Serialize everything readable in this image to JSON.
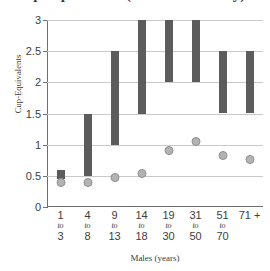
{
  "chart_data": {
    "type": "bar",
    "title": "Cup-Equivalents (Amount of Dairy)",
    "xlabel": "Males (years)",
    "ylabel": "Cup-Equivalents",
    "categories": [
      "1 to 3",
      "4 to 8",
      "9 to 13",
      "14 to 18",
      "19 to 30",
      "31 to 50",
      "51 to 70",
      "71 +"
    ],
    "category_parts": [
      {
        "from": "1",
        "sep": "to",
        "to": "3"
      },
      {
        "from": "4",
        "sep": "to",
        "to": "8"
      },
      {
        "from": "9",
        "sep": "to",
        "to": "13"
      },
      {
        "from": "14",
        "sep": "to",
        "to": "18"
      },
      {
        "from": "19",
        "sep": "to",
        "to": "30"
      },
      {
        "from": "31",
        "sep": "to",
        "to": "50"
      },
      {
        "from": "51",
        "sep": "to",
        "to": "70"
      },
      {
        "from": "71 +",
        "sep": "",
        "to": ""
      }
    ],
    "ylim": [
      0,
      3
    ],
    "yticks": [
      0,
      0.5,
      1,
      1.5,
      2,
      2.5,
      3
    ],
    "ytick_labels": [
      "0",
      "0.5",
      "1",
      "1.5",
      "2",
      "2.5",
      "3"
    ],
    "grid": true,
    "legend": "none",
    "series": [
      {
        "name": "Recommended Intake Range",
        "type": "range-bar",
        "color": "#5c5c5c",
        "ranges": [
          {
            "category": "1 to 3",
            "low": 0.45,
            "high": 0.6
          },
          {
            "category": "4 to 8",
            "low": 0.5,
            "high": 1.5
          },
          {
            "category": "9 to 13",
            "low": 1.0,
            "high": 2.5
          },
          {
            "category": "14 to 18",
            "low": 1.5,
            "high": 3.0
          },
          {
            "category": "19 to 30",
            "low": 2.0,
            "high": 3.0
          },
          {
            "category": "31 to 50",
            "low": 2.0,
            "high": 3.0
          },
          {
            "category": "51 to 70",
            "low": 1.5,
            "high": 2.5
          },
          {
            "category": "71 +",
            "low": 1.5,
            "high": 2.5
          }
        ]
      },
      {
        "name": "Average Intake",
        "type": "scatter",
        "color": "#b3b3b3",
        "values": [
          0.4,
          0.4,
          0.47,
          0.54,
          0.9,
          1.05,
          0.83,
          0.76
        ]
      }
    ]
  },
  "colors": {
    "bar": "#5c5c5c",
    "dot_fill": "#b3b3b3",
    "dot_stroke": "#8f8f8f",
    "grid": "#c9c9c9",
    "axis": "#6e6e6e",
    "text": "#3d3d3d",
    "background": "#ffffff"
  }
}
